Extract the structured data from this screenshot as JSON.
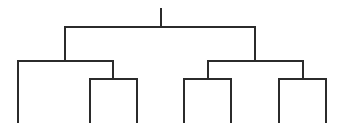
{
  "diagram": {
    "type": "dendrogram",
    "line_color": "#2b2b2b",
    "line_width": 2,
    "background": "#ffffff",
    "leaf_count": 7,
    "leaves": [
      {
        "id": "leaf-1",
        "x": 18
      },
      {
        "id": "leaf-2",
        "x": 90
      },
      {
        "id": "leaf-3",
        "x": 137
      },
      {
        "id": "leaf-4",
        "x": 184
      },
      {
        "id": "leaf-5",
        "x": 231
      },
      {
        "id": "leaf-6",
        "x": 279
      },
      {
        "id": "leaf-7",
        "x": 326
      }
    ],
    "leaf_bottom_y": 122,
    "links": [
      {
        "name": "root-stem",
        "points": [
          [
            161,
            9
          ],
          [
            161,
            27
          ]
        ]
      },
      {
        "name": "root-bar",
        "points": [
          [
            65,
            27
          ],
          [
            255,
            27
          ]
        ]
      },
      {
        "name": "left-branch",
        "points": [
          [
            65,
            27
          ],
          [
            65,
            61
          ]
        ]
      },
      {
        "name": "right-branch",
        "points": [
          [
            255,
            27
          ],
          [
            255,
            61
          ]
        ]
      },
      {
        "name": "left-cluster-bar",
        "points": [
          [
            18,
            61
          ],
          [
            113,
            61
          ]
        ]
      },
      {
        "name": "left-leaf-1",
        "points": [
          [
            18,
            61
          ],
          [
            18,
            122
          ]
        ]
      },
      {
        "name": "left-sub-stem",
        "points": [
          [
            113,
            61
          ],
          [
            113,
            79
          ]
        ]
      },
      {
        "name": "left-sub-bar",
        "points": [
          [
            90,
            79
          ],
          [
            137,
            79
          ]
        ]
      },
      {
        "name": "left-leaf-2",
        "points": [
          [
            90,
            79
          ],
          [
            90,
            122
          ]
        ]
      },
      {
        "name": "left-leaf-3",
        "points": [
          [
            137,
            79
          ],
          [
            137,
            122
          ]
        ]
      },
      {
        "name": "right-cluster-bar",
        "points": [
          [
            208,
            61
          ],
          [
            303,
            61
          ]
        ]
      },
      {
        "name": "right-sub-a-stem",
        "points": [
          [
            208,
            61
          ],
          [
            208,
            79
          ]
        ]
      },
      {
        "name": "right-sub-a-bar",
        "points": [
          [
            184,
            79
          ],
          [
            231,
            79
          ]
        ]
      },
      {
        "name": "right-leaf-4",
        "points": [
          [
            184,
            79
          ],
          [
            184,
            122
          ]
        ]
      },
      {
        "name": "right-leaf-5",
        "points": [
          [
            231,
            79
          ],
          [
            231,
            122
          ]
        ]
      },
      {
        "name": "right-sub-b-stem",
        "points": [
          [
            303,
            61
          ],
          [
            303,
            79
          ]
        ]
      },
      {
        "name": "right-sub-b-bar",
        "points": [
          [
            279,
            79
          ],
          [
            326,
            79
          ]
        ]
      },
      {
        "name": "right-leaf-6",
        "points": [
          [
            279,
            79
          ],
          [
            279,
            122
          ]
        ]
      },
      {
        "name": "right-leaf-7",
        "points": [
          [
            326,
            79
          ],
          [
            326,
            122
          ]
        ]
      }
    ]
  }
}
